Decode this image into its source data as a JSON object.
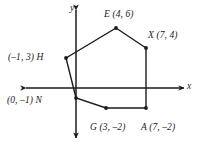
{
  "figure": {
    "type": "coordinate-plane-polygon",
    "background_color": "#ffffff",
    "stroke_color": "#1b1b1b",
    "axes": {
      "x_label": "x",
      "y_label": "y",
      "origin_px": [
        76,
        88
      ],
      "unit_px": 10,
      "x_range_px": [
        24,
        186
      ],
      "y_range_px": [
        8,
        140
      ],
      "arrowheads": [
        "left",
        "right",
        "up",
        "down"
      ],
      "ticks_shown": false,
      "grid": false
    },
    "polygon": {
      "name": "EXAGNH",
      "closed": true,
      "vertex_order": [
        "E",
        "X",
        "A",
        "G",
        "N",
        "H"
      ],
      "vertices": [
        {
          "name": "E",
          "x": 4,
          "y": 6,
          "label": "E (4, 6)",
          "label_pos": "above"
        },
        {
          "name": "X",
          "x": 7,
          "y": 4,
          "label": "X (7, 4)",
          "label_pos": "right"
        },
        {
          "name": "A",
          "x": 7,
          "y": -2,
          "label": "A (7, -2)",
          "label_pos": "below-right"
        },
        {
          "name": "G",
          "x": 3,
          "y": -2,
          "label": "G (3, -2)",
          "label_pos": "below"
        },
        {
          "name": "N",
          "x": 0,
          "y": -1,
          "label": "(0, -1) N",
          "label_pos": "left"
        },
        {
          "name": "H",
          "x": -1,
          "y": 3,
          "label": "(-1, 3) H",
          "label_pos": "left"
        }
      ]
    }
  },
  "labels": {
    "E": "E (4, 6)",
    "X": "X (7, 4)",
    "H": "(–1, 3) H",
    "N": "(0, –1) N",
    "G": "G (3, –2)",
    "A": "A (7, –2)",
    "x_axis": "x",
    "y_axis": "y"
  }
}
